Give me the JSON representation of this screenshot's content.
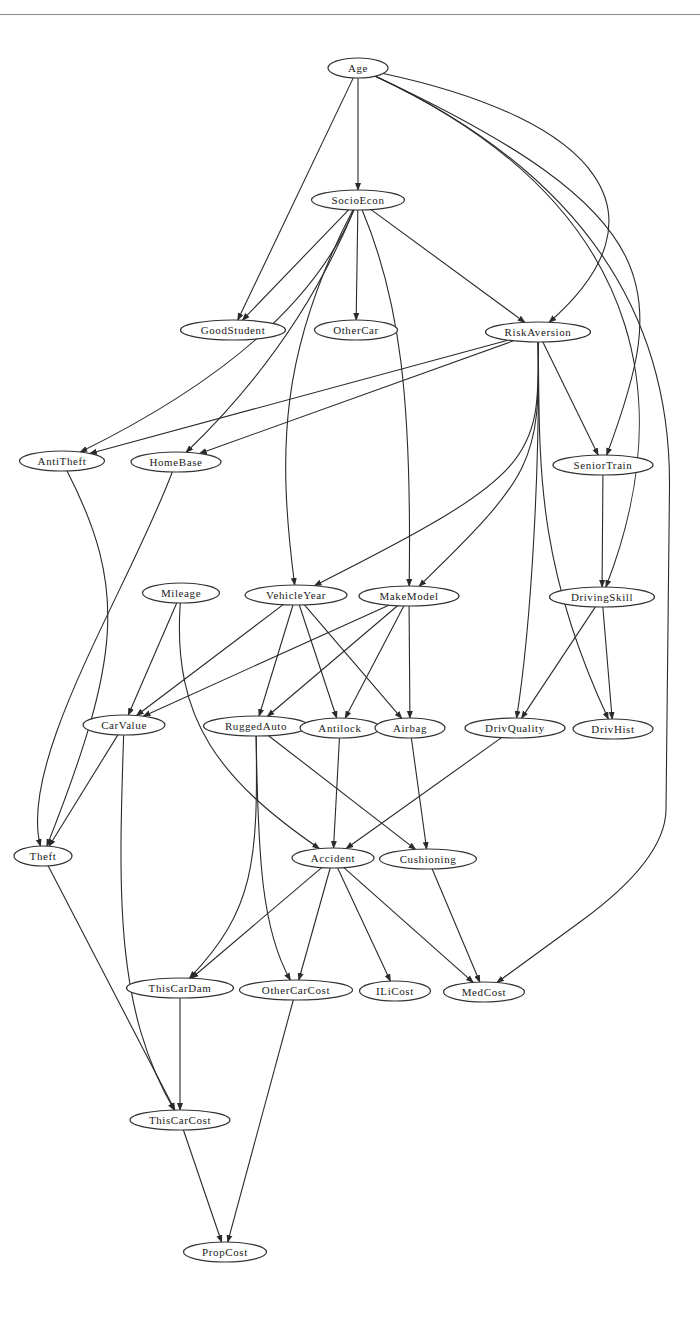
{
  "header": {
    "partial_text": ""
  },
  "diagram": {
    "type": "directed-acyclic-graph",
    "title": "",
    "nodes": [
      {
        "id": "Age",
        "label": "Age",
        "x": 358,
        "y": 68,
        "w": 60
      },
      {
        "id": "SocioEcon",
        "label": "SocioEcon",
        "x": 358,
        "y": 200,
        "w": 93
      },
      {
        "id": "GoodStudent",
        "label": "GoodStudent",
        "x": 233,
        "y": 330,
        "w": 105
      },
      {
        "id": "OtherCar",
        "label": "OtherCar",
        "x": 356,
        "y": 330,
        "w": 83
      },
      {
        "id": "RiskAversion",
        "label": "RiskAversion",
        "x": 538,
        "y": 332,
        "w": 105
      },
      {
        "id": "AntiTheft",
        "label": "AntiTheft",
        "x": 62,
        "y": 461,
        "w": 85
      },
      {
        "id": "HomeBase",
        "label": "HomeBase",
        "x": 176,
        "y": 462,
        "w": 90
      },
      {
        "id": "SeniorTrain",
        "label": "SeniorTrain",
        "x": 603,
        "y": 465,
        "w": 100
      },
      {
        "id": "Mileage",
        "label": "Mileage",
        "x": 181,
        "y": 593,
        "w": 77
      },
      {
        "id": "VehicleYear",
        "label": "VehicleYear",
        "x": 296,
        "y": 595,
        "w": 102
      },
      {
        "id": "MakeModel",
        "label": "MakeModel",
        "x": 409,
        "y": 596,
        "w": 100
      },
      {
        "id": "DrivingSkill",
        "label": "DrivingSkill",
        "x": 602,
        "y": 597,
        "w": 105
      },
      {
        "id": "CarValue",
        "label": "CarValue",
        "x": 124,
        "y": 725,
        "w": 82
      },
      {
        "id": "RuggedAuto",
        "label": "RuggedAuto",
        "x": 256,
        "y": 726,
        "w": 105
      },
      {
        "id": "Antilock",
        "label": "Antilock",
        "x": 340,
        "y": 728,
        "w": 80
      },
      {
        "id": "Airbag",
        "label": "Airbag",
        "x": 410,
        "y": 728,
        "w": 70
      },
      {
        "id": "DrivQuality",
        "label": "DrivQuality",
        "x": 515,
        "y": 728,
        "w": 100
      },
      {
        "id": "DrivHist",
        "label": "DrivHist",
        "x": 613,
        "y": 729,
        "w": 80
      },
      {
        "id": "Theft",
        "label": "Theft",
        "x": 43,
        "y": 856,
        "w": 58
      },
      {
        "id": "Accident",
        "label": "Accident",
        "x": 333,
        "y": 858,
        "w": 82
      },
      {
        "id": "Cushioning",
        "label": "Cushioning",
        "x": 428,
        "y": 859,
        "w": 97
      },
      {
        "id": "ThisCarDam",
        "label": "ThisCarDam",
        "x": 180,
        "y": 988,
        "w": 107
      },
      {
        "id": "OtherCarCost",
        "label": "OtherCarCost",
        "x": 296,
        "y": 990,
        "w": 113
      },
      {
        "id": "ILiCost",
        "label": "ILiCost",
        "x": 395,
        "y": 991,
        "w": 71
      },
      {
        "id": "MedCost",
        "label": "MedCost",
        "x": 484,
        "y": 992,
        "w": 81
      },
      {
        "id": "ThisCarCost",
        "label": "ThisCarCost",
        "x": 180,
        "y": 1120,
        "w": 100
      },
      {
        "id": "PropCost",
        "label": "PropCost",
        "x": 225,
        "y": 1252,
        "w": 83
      }
    ],
    "edges": [
      {
        "from": "Age",
        "to": "SocioEcon"
      },
      {
        "from": "Age",
        "to": "GoodStudent"
      },
      {
        "from": "Age",
        "to": "RiskAversion",
        "via": [
          [
            600,
            120
          ],
          [
            672,
            215
          ]
        ]
      },
      {
        "from": "Age",
        "to": "SeniorTrain",
        "via": [
          [
            672,
            215
          ],
          [
            668,
            290
          ]
        ]
      },
      {
        "from": "Age",
        "to": "DrivingSkill",
        "via": [
          [
            672,
            215
          ],
          [
            667,
            430
          ]
        ]
      },
      {
        "from": "Age",
        "to": "MedCost",
        "via": [
          [
            672,
            215
          ],
          [
            667,
            760
          ],
          [
            665,
            860
          ]
        ]
      },
      {
        "from": "SocioEcon",
        "to": "GoodStudent"
      },
      {
        "from": "SocioEcon",
        "to": "OtherCar"
      },
      {
        "from": "SocioEcon",
        "to": "RiskAversion"
      },
      {
        "from": "SocioEcon",
        "to": "AntiTheft",
        "via": [
          [
            298,
            345
          ]
        ]
      },
      {
        "from": "SocioEcon",
        "to": "HomeBase",
        "via": [
          [
            298,
            345
          ]
        ]
      },
      {
        "from": "SocioEcon",
        "to": "VehicleYear",
        "via": [
          [
            280,
            350
          ],
          [
            277,
            450
          ]
        ]
      },
      {
        "from": "SocioEcon",
        "to": "MakeModel",
        "via": [
          [
            400,
            300
          ],
          [
            412,
            400
          ]
        ]
      },
      {
        "from": "RiskAversion",
        "to": "AntiTheft"
      },
      {
        "from": "RiskAversion",
        "to": "HomeBase"
      },
      {
        "from": "RiskAversion",
        "to": "SeniorTrain"
      },
      {
        "from": "RiskAversion",
        "to": "VehicleYear",
        "via": [
          [
            540,
            460
          ],
          [
            534,
            475
          ]
        ]
      },
      {
        "from": "RiskAversion",
        "to": "MakeModel",
        "via": [
          [
            540,
            460
          ],
          [
            534,
            475
          ]
        ]
      },
      {
        "from": "RiskAversion",
        "to": "DrivQuality",
        "via": [
          [
            540,
            460
          ],
          [
            532,
            620
          ]
        ]
      },
      {
        "from": "RiskAversion",
        "to": "DrivHist",
        "via": [
          [
            540,
            460
          ],
          [
            534,
            560
          ]
        ]
      },
      {
        "from": "SeniorTrain",
        "to": "DrivingSkill"
      },
      {
        "from": "AntiTheft",
        "to": "Theft",
        "via": [
          [
            128,
            590
          ],
          [
            120,
            660
          ]
        ]
      },
      {
        "from": "HomeBase",
        "to": "Theft",
        "via": [
          [
            128,
            590
          ],
          [
            18,
            760
          ]
        ]
      },
      {
        "from": "Mileage",
        "to": "CarValue"
      },
      {
        "from": "Mileage",
        "to": "Accident",
        "via": [
          [
            172,
            720
          ],
          [
            220,
            780
          ]
        ]
      },
      {
        "from": "VehicleYear",
        "to": "CarValue"
      },
      {
        "from": "VehicleYear",
        "to": "RuggedAuto"
      },
      {
        "from": "VehicleYear",
        "to": "Antilock"
      },
      {
        "from": "VehicleYear",
        "to": "Airbag"
      },
      {
        "from": "MakeModel",
        "to": "CarValue"
      },
      {
        "from": "MakeModel",
        "to": "RuggedAuto"
      },
      {
        "from": "MakeModel",
        "to": "Antilock"
      },
      {
        "from": "MakeModel",
        "to": "Airbag"
      },
      {
        "from": "DrivingSkill",
        "to": "DrivQuality"
      },
      {
        "from": "DrivingSkill",
        "to": "DrivHist"
      },
      {
        "from": "CarValue",
        "to": "Theft"
      },
      {
        "from": "CarValue",
        "to": "ThisCarCost",
        "via": [
          [
            118,
            900
          ],
          [
            116,
            1010
          ]
        ]
      },
      {
        "from": "RuggedAuto",
        "to": "Cushioning"
      },
      {
        "from": "RuggedAuto",
        "to": "ThisCarDam",
        "via": [
          [
            258,
            860
          ],
          [
            255,
            910
          ]
        ]
      },
      {
        "from": "RuggedAuto",
        "to": "OtherCarCost",
        "via": [
          [
            258,
            860
          ],
          [
            262,
            930
          ]
        ]
      },
      {
        "from": "Antilock",
        "to": "Accident"
      },
      {
        "from": "Airbag",
        "to": "Cushioning"
      },
      {
        "from": "DrivQuality",
        "to": "Accident"
      },
      {
        "from": "Theft",
        "to": "ThisCarCost"
      },
      {
        "from": "Accident",
        "to": "ThisCarDam"
      },
      {
        "from": "Accident",
        "to": "OtherCarCost"
      },
      {
        "from": "Accident",
        "to": "ILiCost"
      },
      {
        "from": "Accident",
        "to": "MedCost"
      },
      {
        "from": "Cushioning",
        "to": "MedCost"
      },
      {
        "from": "ThisCarDam",
        "to": "ThisCarCost"
      },
      {
        "from": "OtherCarCost",
        "to": "PropCost"
      },
      {
        "from": "ThisCarCost",
        "to": "PropCost"
      }
    ]
  },
  "style": {
    "edge_color": "#2a2a2a",
    "node_stroke": "#333333",
    "node_fill": "#ffffff",
    "text_color": "#222222",
    "rule_color": "#8a8a8a"
  }
}
